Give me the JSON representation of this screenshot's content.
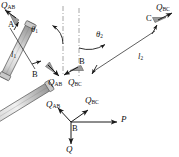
{
  "figure": {
    "type": "statics-free-body-diagram",
    "colors": {
      "bar_light": "#e6e6e6",
      "bar_mid": "#b8b8b8",
      "bar_dark": "#8a8a8a",
      "outline": "#5a5a5a",
      "ink": "#111111",
      "centerline": "#8f8f8f"
    }
  },
  "bar_ab": {
    "name": "bar-ab",
    "node_a": "A",
    "node_b": "B",
    "force_top": {
      "base": "Q",
      "sub": "AB"
    },
    "force_bottom": {
      "base": "Q",
      "sub": "AB"
    },
    "angle": {
      "base": "θ",
      "sub": "1"
    },
    "length": {
      "base": "l",
      "sub": "1"
    }
  },
  "bar_bc": {
    "name": "bar-bc",
    "node_b": "B",
    "node_c": "C",
    "force_top": {
      "base": "Q",
      "sub": "BC"
    },
    "force_bottom": {
      "base": "Q",
      "sub": "BC"
    },
    "angle": {
      "base": "θ",
      "sub": "2"
    },
    "length": {
      "base": "l",
      "sub": "2"
    }
  },
  "joint_fbd": {
    "name": "joint-b-free-body",
    "joint": "B",
    "force_left": {
      "base": "Q",
      "sub": "AB"
    },
    "force_right": {
      "base": "Q",
      "sub": "BC"
    },
    "force_horizontal": {
      "base": "P",
      "sub": ""
    },
    "force_down": {
      "base": "Q",
      "sub": ""
    }
  }
}
